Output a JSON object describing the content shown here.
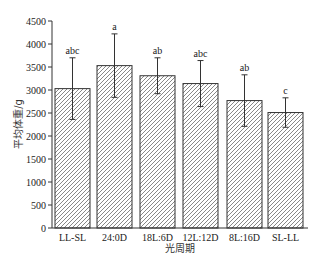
{
  "chart_data": {
    "type": "bar",
    "title": "",
    "xlabel": "光周期",
    "ylabel": "平均体重/g",
    "ylim": [
      0,
      4500
    ],
    "yticks": [
      0,
      500,
      1000,
      1500,
      2000,
      2500,
      3000,
      3500,
      4000,
      4500
    ],
    "grid": false,
    "legend": null,
    "categories": [
      "LL-SL",
      "24:0D",
      "18L:6D",
      "12L:12D",
      "8L:16D",
      "SL-LL"
    ],
    "values": [
      3030,
      3530,
      3310,
      3140,
      2770,
      2510
    ],
    "error": [
      670,
      690,
      390,
      500,
      560,
      320
    ],
    "significance_labels": [
      "abc",
      "a",
      "ab",
      "abc",
      "ab",
      "c"
    ],
    "bar_style": "diagonal hatch, black outline, white fill"
  },
  "colors": {
    "axis": "#333333",
    "bar_outline": "#333333",
    "hatch": "#555555",
    "text": "#222222"
  }
}
